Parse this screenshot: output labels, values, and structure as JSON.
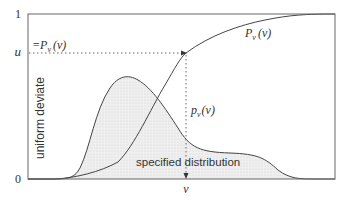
{
  "figure": {
    "y_tick_top": "1",
    "y_tick_bottom": "0",
    "y_tick_u": "u",
    "u_eq_label": "=P",
    "u_eq_sub": "v",
    "u_eq_arg": "(v)",
    "y_axis_label": "uniform deviate",
    "cdf_label": "P",
    "cdf_sub": "v",
    "cdf_arg": "(v)",
    "pdf_label": "p",
    "pdf_sub": "v",
    "pdf_arg": "(v)",
    "distribution_label": "specified distribution",
    "x_tick_v": "v"
  },
  "colors": {
    "axis": "#555555",
    "curve": "#444444",
    "fill": "#ececec",
    "dotted": "#666666"
  }
}
